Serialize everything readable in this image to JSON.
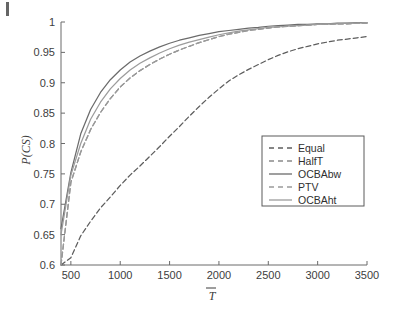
{
  "figure": {
    "background": "#ffffff",
    "page_edge_mark": "page-edge-artifact"
  },
  "chart_data": {
    "type": "line",
    "title": "",
    "subtitle": "",
    "xlabel": "T̄",
    "ylabel": "P(CS)",
    "xlim": [
      400,
      3500
    ],
    "ylim": [
      0.6,
      1.0
    ],
    "grid": false,
    "legend_position": "center-right",
    "xticks": [
      500,
      1000,
      1500,
      2000,
      2500,
      3000,
      3500
    ],
    "xtick_labels": [
      "500",
      "1000",
      "1500",
      "2000",
      "2500",
      "3000",
      "3500"
    ],
    "yticks": [
      0.6,
      0.65,
      0.7,
      0.75,
      0.8,
      0.85,
      0.9,
      0.95,
      1
    ],
    "ytick_labels": [
      "0.6",
      "0.65",
      "0.7",
      "0.75",
      "0.8",
      "0.85",
      "0.9",
      "0.95",
      "1"
    ],
    "x": [
      400,
      500,
      600,
      700,
      800,
      900,
      1000,
      1100,
      1200,
      1300,
      1400,
      1500,
      1600,
      1700,
      1800,
      1900,
      2000,
      2100,
      2200,
      2300,
      2400,
      2500,
      2600,
      2700,
      2800,
      2900,
      3000,
      3100,
      3200,
      3300,
      3400,
      3500
    ],
    "series": [
      {
        "name": "Equal",
        "style": "dashed",
        "color": "#5d5d5d",
        "values": [
          0.6,
          0.612,
          0.648,
          0.672,
          0.694,
          0.712,
          0.731,
          0.748,
          0.763,
          0.779,
          0.795,
          0.812,
          0.828,
          0.845,
          0.861,
          0.876,
          0.89,
          0.903,
          0.913,
          0.922,
          0.93,
          0.938,
          0.945,
          0.951,
          0.956,
          0.96,
          0.964,
          0.967,
          0.97,
          0.972,
          0.974,
          0.976
        ]
      },
      {
        "name": "HalfT",
        "style": "dashed",
        "color": "#8a8a8a",
        "values": [
          0.6,
          0.736,
          0.786,
          0.823,
          0.851,
          0.874,
          0.893,
          0.908,
          0.92,
          0.93,
          0.939,
          0.947,
          0.954,
          0.96,
          0.966,
          0.971,
          0.976,
          0.98,
          0.983,
          0.986,
          0.988,
          0.99,
          0.992,
          0.993,
          0.994,
          0.995,
          0.996,
          0.996,
          0.997,
          0.997,
          0.998,
          0.998
        ]
      },
      {
        "name": "OCBAbw",
        "style": "solid",
        "color": "#6b6b6b",
        "values": [
          0.66,
          0.752,
          0.816,
          0.856,
          0.884,
          0.905,
          0.921,
          0.934,
          0.944,
          0.952,
          0.959,
          0.965,
          0.97,
          0.974,
          0.978,
          0.981,
          0.984,
          0.986,
          0.988,
          0.99,
          0.991,
          0.993,
          0.994,
          0.995,
          0.996,
          0.996,
          0.997,
          0.997,
          0.998,
          0.998,
          0.999,
          0.999
        ]
      },
      {
        "name": "PTV",
        "style": "dashed",
        "color": "#9a9a9a",
        "values": [
          0.6,
          0.736,
          0.786,
          0.823,
          0.851,
          0.874,
          0.893,
          0.908,
          0.92,
          0.93,
          0.939,
          0.947,
          0.954,
          0.96,
          0.966,
          0.971,
          0.976,
          0.98,
          0.983,
          0.986,
          0.988,
          0.99,
          0.992,
          0.993,
          0.994,
          0.995,
          0.996,
          0.996,
          0.997,
          0.997,
          0.998,
          0.998
        ]
      },
      {
        "name": "OCBAht",
        "style": "solid",
        "color": "#9c9c9c",
        "values": [
          0.65,
          0.748,
          0.8,
          0.84,
          0.868,
          0.89,
          0.907,
          0.921,
          0.932,
          0.941,
          0.949,
          0.956,
          0.962,
          0.967,
          0.971,
          0.975,
          0.979,
          0.982,
          0.985,
          0.987,
          0.989,
          0.991,
          0.992,
          0.993,
          0.994,
          0.995,
          0.996,
          0.997,
          0.997,
          0.998,
          0.998,
          0.999
        ]
      }
    ]
  },
  "legend": {
    "entries": [
      {
        "label": "Equal"
      },
      {
        "label": "HalfT"
      },
      {
        "label": "OCBAbw"
      },
      {
        "label": "PTV"
      },
      {
        "label": "OCBAht"
      }
    ]
  }
}
